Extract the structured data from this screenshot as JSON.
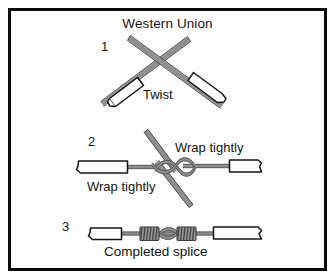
{
  "figure": {
    "title": "Western Union",
    "kind": "wire-splice-instruction-diagram",
    "border_color": "#0b0b0b",
    "background_color": "#ffffff",
    "wire_color": "#8a8a8a",
    "wire_outline_color": "#3c3c3c",
    "insulation_fill": "#ffffff",
    "insulation_outline": "#1a1a1a",
    "text_color": "#141414"
  },
  "steps": [
    {
      "number": "1",
      "caption": "Twist",
      "description": "Two stripped conductors crossed in an X with insulation jackets on the outer ends"
    },
    {
      "number": "2",
      "caption_top": "Wrap tightly",
      "caption_bottom": "Wrap tightly",
      "description": "Conductors laid parallel and twisted around one another at the centre with free ends protruding"
    },
    {
      "number": "3",
      "caption": "Completed splice",
      "description": "Finished splice with tight coils wrapped on both sides of the joint"
    }
  ]
}
